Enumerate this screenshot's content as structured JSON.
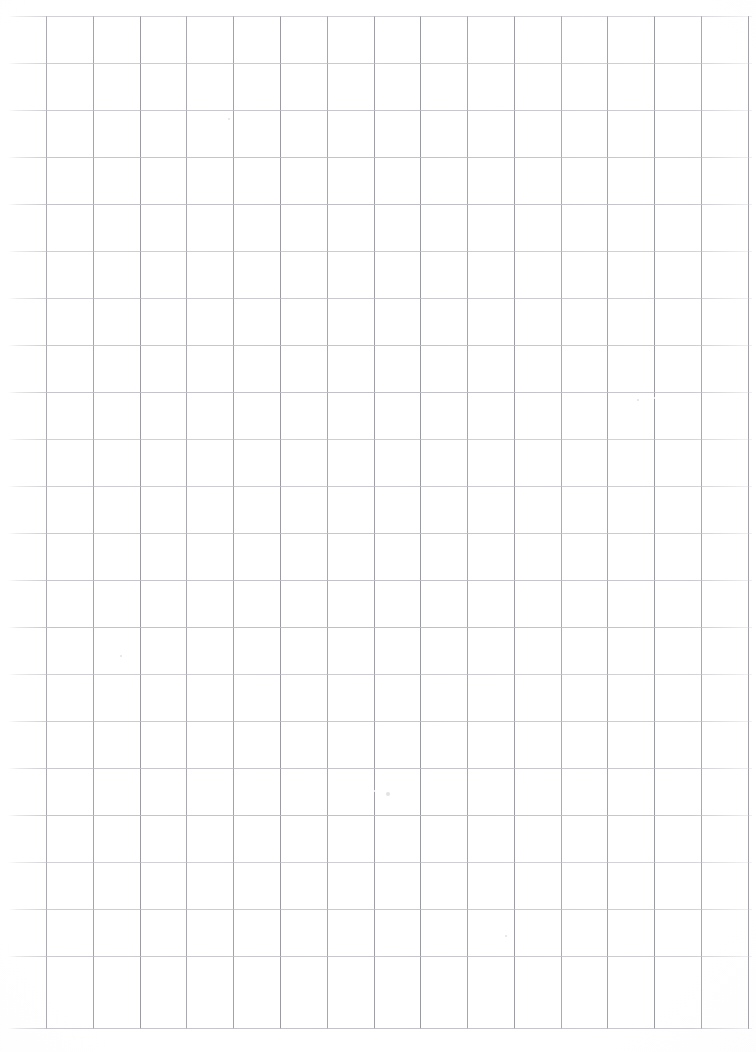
{
  "document": {
    "title": "Grid Paper Sheet",
    "kind": "scanned blank grid / graph paper",
    "page_width": 756,
    "page_height": 1052,
    "background_color": "#ffffff",
    "has_text": false,
    "has_handwriting": false,
    "visible_text": ""
  },
  "grid": {
    "cell_width": 46.7,
    "cell_height": 46.8,
    "vertical_line_color": "#a9a9ae",
    "horizontal_line_color": "#bababf",
    "line_thickness": 1,
    "vertical_line_count": 16,
    "horizontal_line_count": 22,
    "vertical_x_positions": [
      46,
      93,
      140,
      186,
      233,
      280,
      327,
      374,
      420,
      467,
      514,
      561,
      607,
      654,
      701,
      748
    ],
    "horizontal_y_positions": [
      16,
      63,
      110,
      157,
      204,
      251,
      298,
      345,
      392,
      439,
      486,
      533,
      580,
      627,
      674,
      721,
      768,
      815,
      862,
      909,
      956,
      1028
    ],
    "vertical_line_top": 16,
    "vertical_line_bottom": 1029,
    "horizontal_line_left": 8,
    "horizontal_line_right": 752,
    "left_margin_px": 46,
    "top_margin_px": 16,
    "bottom_margin_px": 23,
    "right_margin_px": 8
  },
  "artifacts": {
    "description": "faint scan specks and a light smudge on the paper",
    "specks": [
      {
        "x": 386,
        "y": 792,
        "size": 4
      },
      {
        "x": 228,
        "y": 118,
        "size": 2
      },
      {
        "x": 637,
        "y": 399,
        "size": 2
      },
      {
        "x": 120,
        "y": 655,
        "size": 2
      },
      {
        "x": 505,
        "y": 935,
        "size": 2
      }
    ],
    "line_gaps": [
      {
        "x": 612,
        "y": 398,
        "width": 44
      },
      {
        "x": 352,
        "y": 791,
        "width": 36
      }
    ]
  }
}
